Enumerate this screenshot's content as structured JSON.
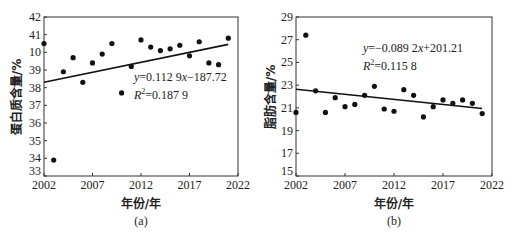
{
  "chart_data": [
    {
      "type": "scatter",
      "panel": "(a)",
      "title": "",
      "xlabel": "年份/年",
      "ylabel": "蛋白质含量/%",
      "xlim": [
        2002,
        2022
      ],
      "ylim": [
        33,
        42
      ],
      "x_ticks": [
        "2002",
        "2007",
        "2012",
        "2017",
        "2022"
      ],
      "y_ticks": [
        "33",
        "34",
        "35",
        "36",
        "37",
        "38",
        "39",
        "10",
        "41",
        "42"
      ],
      "x": [
        2002,
        2003,
        2004,
        2005,
        2006,
        2007,
        2008,
        2009,
        2010,
        2011,
        2012,
        2013,
        2014,
        2015,
        2016,
        2017,
        2018,
        2019,
        2020,
        2021
      ],
      "values": [
        40.5,
        33.9,
        38.9,
        39.7,
        38.3,
        39.4,
        39.9,
        40.5,
        37.7,
        39.2,
        40.7,
        40.3,
        40.1,
        40.2,
        40.4,
        39.8,
        40.6,
        39.4,
        39.3,
        40.8
      ],
      "trendline": {
        "slope": 0.1129,
        "intercept": -187.72,
        "r2": 0.1879
      },
      "annotations": [
        "y=0.112 9x−187.72",
        "R²=0.187 9"
      ],
      "grid": false
    },
    {
      "type": "scatter",
      "panel": "(b)",
      "title": "",
      "xlabel": "年份/年",
      "ylabel": "脂肪含量/%",
      "xlim": [
        2002,
        2022
      ],
      "ylim": [
        15,
        29
      ],
      "x_ticks": [
        "2002",
        "2007",
        "2012",
        "2017",
        "2022"
      ],
      "y_ticks": [
        "15",
        "17",
        "19",
        "21",
        "23",
        "25",
        "27",
        "29"
      ],
      "x": [
        2002,
        2003,
        2004,
        2005,
        2006,
        2007,
        2008,
        2009,
        2010,
        2011,
        2012,
        2013,
        2014,
        2015,
        2016,
        2017,
        2018,
        2019,
        2020,
        2021
      ],
      "values": [
        20.6,
        27.4,
        22.5,
        20.6,
        21.9,
        21.1,
        21.3,
        22.1,
        22.9,
        20.9,
        20.7,
        22.6,
        22.1,
        20.2,
        21.1,
        21.7,
        21.4,
        21.7,
        21.4,
        20.5
      ],
      "trendline": {
        "slope": -0.0892,
        "intercept": 201.21,
        "r2": 0.1158
      },
      "annotations": [
        "y=−0.089 2x+201.21",
        "R²=0.115 8"
      ],
      "grid": false
    }
  ],
  "panels": {
    "a": {
      "caption": "(a)",
      "xlabel": "年份/年",
      "ylabel": "蛋白质含量/%",
      "eq_y": "y",
      "eq_rest": "=0.112 9",
      "eq_x": "x",
      "eq_tail": "−187.72",
      "r2_R": "R",
      "r2_sup": "2",
      "r2_val": "=0.187 9",
      "xticks": [
        "2002",
        "2007",
        "2012",
        "2017",
        "2022"
      ],
      "yticks": [
        "33",
        "34",
        "35",
        "36",
        "37",
        "38",
        "39",
        "10",
        "41",
        "42"
      ]
    },
    "b": {
      "caption": "(b)",
      "xlabel": "年份/年",
      "ylabel": "脂肪含量/%",
      "eq_y": "y",
      "eq_rest": "=−0.089 2",
      "eq_x": "x",
      "eq_tail": "+201.21",
      "r2_R": "R",
      "r2_sup": "2",
      "r2_val": "=0.115 8",
      "xticks": [
        "2002",
        "2007",
        "2012",
        "2017",
        "2022"
      ],
      "yticks": [
        "15",
        "17",
        "19",
        "21",
        "23",
        "25",
        "27",
        "29"
      ]
    }
  },
  "style": {
    "ink": "#111111",
    "background": "#ffffff"
  }
}
